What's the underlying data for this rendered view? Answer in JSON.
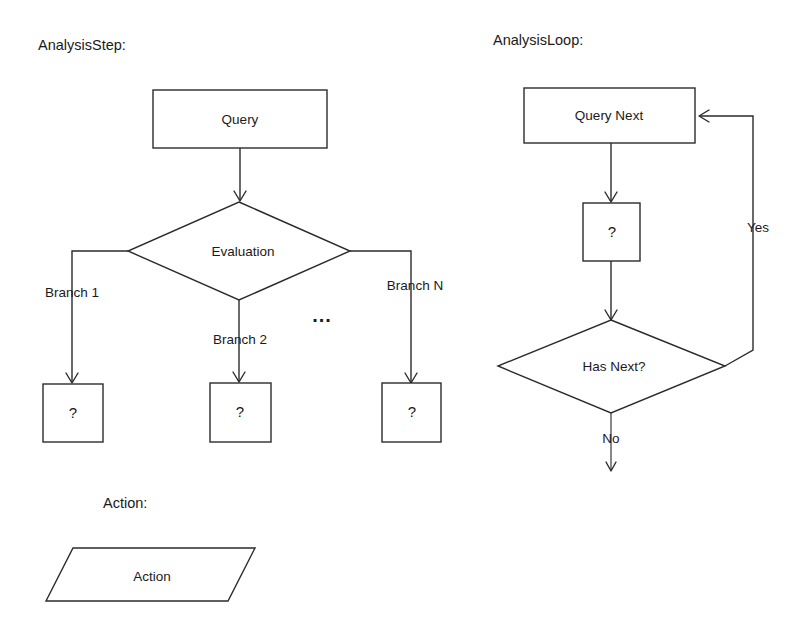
{
  "page": {
    "background": "#ffffff",
    "ink": "#2b2b2b",
    "width": 802,
    "height": 644
  },
  "sections": {
    "analysis_step": {
      "title": "AnalysisStep:",
      "nodes": {
        "query": "Query",
        "evaluation": "Evaluation",
        "branch1_target": "?",
        "branch2_target": "?",
        "branchN_target": "?"
      },
      "edge_labels": {
        "branch1": "Branch 1",
        "branch2": "Branch 2",
        "branchN": "Branch N",
        "ellipsis": "..."
      }
    },
    "analysis_loop": {
      "title": "AnalysisLoop:",
      "nodes": {
        "query_next": "Query Next",
        "step_placeholder": "?",
        "has_next": "Has Next?"
      },
      "edge_labels": {
        "yes": "Yes",
        "no": "No"
      }
    },
    "action": {
      "title": "Action:",
      "nodes": {
        "action": "Action"
      }
    }
  }
}
